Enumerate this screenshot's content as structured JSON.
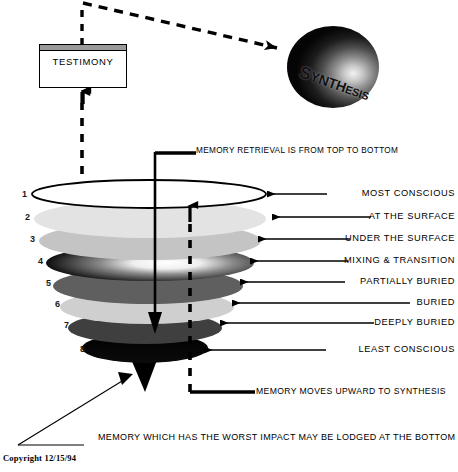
{
  "diagram": {
    "testimony": {
      "label": "TESTIMONY",
      "titlebar_color": "#9a9a9a"
    },
    "sphere": {
      "label": "SYNTHESIS",
      "label_parts": {
        "big": "S",
        "mid": "YNTH",
        "small": "ESIS"
      },
      "fill_dark": "#050505",
      "fill_light": "#f2f2f2"
    },
    "notes": {
      "retrieval": "MEMORY RETRIEVAL IS FROM TOP TO BOTTOM",
      "upward": "MEMORY MOVES UPWARD TO SYNTHESIS",
      "bottom": "MEMORY WHICH HAS THE WORST IMPACT MAY BE LODGED AT THE BOTTOM",
      "copyright": "Copyright 12/15/94"
    },
    "layers": [
      {
        "number": "1",
        "label": "MOST CONSCIOUS",
        "color": "#ffffff",
        "label_y": 190
      },
      {
        "number": "2",
        "label": "AT THE SURFACE",
        "color": "#e3e3e3",
        "label_y": 214
      },
      {
        "number": "3",
        "label": "UNDER THE SURFACE",
        "color": "#c4c4c4",
        "label_y": 236
      },
      {
        "number": "4",
        "label": "MIXING & TRANSITION",
        "color": "#111111",
        "label_y": 258
      },
      {
        "number": "5",
        "label": "PARTIALLY BURIED",
        "color": "#5f5f5f",
        "label_y": 279
      },
      {
        "number": "6",
        "label": "BURIED",
        "color": "#cfcfcf",
        "label_y": 300
      },
      {
        "number": "7",
        "label": "DEEPLY BURIED",
        "color": "#3f3f3f",
        "label_y": 320
      },
      {
        "number": "8",
        "label": "LEAST CONSCIOUS",
        "color": "#050505",
        "label_y": 347
      }
    ]
  }
}
